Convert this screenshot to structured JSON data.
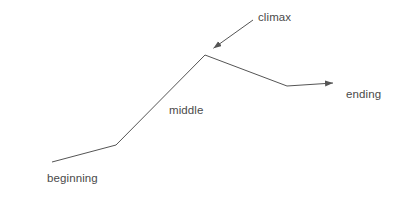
{
  "diagram": {
    "type": "narrative-arc-line-diagram",
    "background_color": "#ffffff",
    "stroke_color": "#555555",
    "text_color": "#4a4a4a",
    "stroke_width": 1,
    "canvas": {
      "width": 403,
      "height": 200
    },
    "labels": {
      "beginning": "beginning",
      "middle": "middle",
      "climax": "climax",
      "ending": "ending"
    },
    "story_arc": {
      "points": [
        {
          "name": "start",
          "x": 52,
          "y": 162
        },
        {
          "name": "inciting-bend",
          "x": 116,
          "y": 145
        },
        {
          "name": "climax-peak",
          "x": 205,
          "y": 55
        },
        {
          "name": "resolution-bend",
          "x": 287,
          "y": 86
        },
        {
          "name": "ending-arrow-tip",
          "x": 333,
          "y": 83
        }
      ]
    },
    "annotation_arrow": {
      "name": "climax-pointer",
      "from": {
        "x": 253,
        "y": 20
      },
      "to": {
        "x": 211,
        "y": 50
      }
    },
    "arrowheads": [
      {
        "name": "ending-arrowhead",
        "x": 333,
        "y": 83,
        "direction": "right"
      },
      {
        "name": "climax-arrowhead",
        "x": 211,
        "y": 50,
        "direction": "down-left"
      }
    ]
  },
  "chart_data": {
    "type": "line",
    "title": "",
    "xlabel": "",
    "ylabel": "",
    "grid": false,
    "legend": "none",
    "annotations": [
      "beginning",
      "middle",
      "climax",
      "ending"
    ],
    "series": [
      {
        "name": "story-arc",
        "points": [
          {
            "x": 52,
            "y": 162
          },
          {
            "x": 116,
            "y": 145
          },
          {
            "x": 205,
            "y": 55
          },
          {
            "x": 287,
            "y": 86
          },
          {
            "x": 333,
            "y": 83
          }
        ]
      }
    ]
  }
}
